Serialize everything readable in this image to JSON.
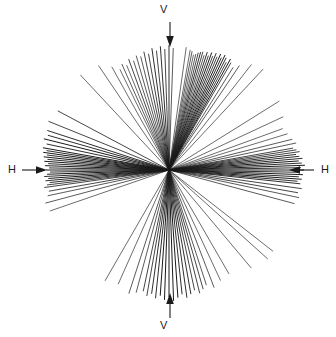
{
  "figure": {
    "title": "",
    "background_color": "#ffffff",
    "line_color": "#1a1a1a",
    "width": 336,
    "height": 337
  },
  "labels": {
    "v_top": "V",
    "v_bottom": "V",
    "h_left": "H",
    "h_right": "H"
  },
  "icons": {
    "arrow_down": "arrow-down-icon",
    "arrow_up": "arrow-up-icon",
    "arrow_right": "arrow-right-icon",
    "arrow_left": "arrow-left-icon"
  },
  "chart_data": {
    "type": "line",
    "title": "",
    "xlabel": "",
    "ylabel": "",
    "grid": false,
    "legend": null,
    "center": [
      169,
      170
    ],
    "axis_arrows": [
      {
        "name": "v-top",
        "label": "V",
        "direction": "down",
        "x": 170,
        "y1": 22,
        "y2": 46
      },
      {
        "name": "v-bottom",
        "label": "V",
        "direction": "up",
        "x": 170,
        "y1": 318,
        "y2": 294
      },
      {
        "name": "h-left",
        "label": "H",
        "direction": "right",
        "y": 170,
        "x1": 22,
        "x2": 46
      },
      {
        "name": "h-right",
        "label": "H",
        "direction": "left",
        "y": 170,
        "x1": 314,
        "x2": 290
      }
    ],
    "rays": [
      {
        "angle_deg": 82,
        "r_inner": 0,
        "r_outer": 124,
        "weight": 0.6
      },
      {
        "angle_deg": 80,
        "r_inner": 0,
        "r_outer": 122,
        "weight": 0.6
      },
      {
        "angle_deg": 79,
        "r_inner": 0,
        "r_outer": 121,
        "weight": 0.7
      },
      {
        "angle_deg": 78,
        "r_inner": 0,
        "r_outer": 118,
        "weight": 0.6
      },
      {
        "angle_deg": 77,
        "r_inner": 0,
        "r_outer": 119,
        "weight": 0.7
      },
      {
        "angle_deg": 76,
        "r_inner": 0,
        "r_outer": 121,
        "weight": 0.8
      },
      {
        "angle_deg": 75,
        "r_inner": 0,
        "r_outer": 122,
        "weight": 0.9
      },
      {
        "angle_deg": 74,
        "r_inner": 0,
        "r_outer": 123,
        "weight": 0.8
      },
      {
        "angle_deg": 73,
        "r_inner": 0,
        "r_outer": 120,
        "weight": 0.7
      },
      {
        "angle_deg": 72,
        "r_inner": 0,
        "r_outer": 124,
        "weight": 0.9
      },
      {
        "angle_deg": 71,
        "r_inner": 0,
        "r_outer": 121,
        "weight": 0.8
      },
      {
        "angle_deg": 70,
        "r_inner": 0,
        "r_outer": 125,
        "weight": 1.0
      },
      {
        "angle_deg": 69,
        "r_inner": 0,
        "r_outer": 122,
        "weight": 0.8
      },
      {
        "angle_deg": 68,
        "r_inner": 0,
        "r_outer": 126,
        "weight": 0.9
      },
      {
        "angle_deg": 67,
        "r_inner": 0,
        "r_outer": 123,
        "weight": 0.8
      },
      {
        "angle_deg": 66,
        "r_inner": 0,
        "r_outer": 127,
        "weight": 1.0
      },
      {
        "angle_deg": 65,
        "r_inner": 0,
        "r_outer": 124,
        "weight": 0.9
      },
      {
        "angle_deg": 64,
        "r_inner": 0,
        "r_outer": 128,
        "weight": 1.0
      },
      {
        "angle_deg": 63,
        "r_inner": 0,
        "r_outer": 126,
        "weight": 0.9
      },
      {
        "angle_deg": 62,
        "r_inner": 0,
        "r_outer": 122,
        "weight": 0.8
      },
      {
        "angle_deg": 61,
        "r_inner": 0,
        "r_outer": 127,
        "weight": 1.0
      },
      {
        "angle_deg": 60,
        "r_inner": 0,
        "r_outer": 124,
        "weight": 0.8
      },
      {
        "angle_deg": 58,
        "r_inner": 0,
        "r_outer": 121,
        "weight": 0.7
      },
      {
        "angle_deg": 56,
        "r_inner": 0,
        "r_outer": 126,
        "weight": 0.7
      },
      {
        "angle_deg": 52,
        "r_inner": 0,
        "r_outer": 134,
        "weight": 0.6
      },
      {
        "angle_deg": 47,
        "r_inner": 0,
        "r_outer": 138,
        "weight": 0.6
      },
      {
        "angle_deg": 88,
        "r_inner": 0,
        "r_outer": 122,
        "weight": 0.7
      },
      {
        "angle_deg": 90,
        "r_inner": 0,
        "r_outer": 125,
        "weight": 0.9
      },
      {
        "angle_deg": 92,
        "r_inner": 0,
        "r_outer": 121,
        "weight": 0.8
      },
      {
        "angle_deg": 94,
        "r_inner": 0,
        "r_outer": 124,
        "weight": 0.9
      },
      {
        "angle_deg": 96,
        "r_inner": 0,
        "r_outer": 120,
        "weight": 0.8
      },
      {
        "angle_deg": 98,
        "r_inner": 0,
        "r_outer": 123,
        "weight": 0.9
      },
      {
        "angle_deg": 100,
        "r_inner": 0,
        "r_outer": 118,
        "weight": 0.8
      },
      {
        "angle_deg": 102,
        "r_inner": 0,
        "r_outer": 121,
        "weight": 0.8
      },
      {
        "angle_deg": 104,
        "r_inner": 0,
        "r_outer": 117,
        "weight": 0.7
      },
      {
        "angle_deg": 106,
        "r_inner": 0,
        "r_outer": 119,
        "weight": 0.7
      },
      {
        "angle_deg": 108,
        "r_inner": 0,
        "r_outer": 115,
        "weight": 0.7
      },
      {
        "angle_deg": 110,
        "r_inner": 0,
        "r_outer": 118,
        "weight": 0.8
      },
      {
        "angle_deg": 112,
        "r_inner": 0,
        "r_outer": 113,
        "weight": 0.6
      },
      {
        "angle_deg": 114,
        "r_inner": 0,
        "r_outer": 116,
        "weight": 0.7
      },
      {
        "angle_deg": 116,
        "r_inner": 0,
        "r_outer": 112,
        "weight": 0.6
      },
      {
        "angle_deg": 119,
        "r_inner": 0,
        "r_outer": 118,
        "weight": 0.6
      },
      {
        "angle_deg": 124,
        "r_inner": 0,
        "r_outer": 126,
        "weight": 0.6
      },
      {
        "angle_deg": 133,
        "r_inner": 0,
        "r_outer": 130,
        "weight": 0.6
      },
      {
        "angle_deg": 152,
        "r_inner": 0,
        "r_outer": 126,
        "weight": 0.8
      },
      {
        "angle_deg": 158,
        "r_inner": 0,
        "r_outer": 130,
        "weight": 0.8
      },
      {
        "angle_deg": 162,
        "r_inner": 0,
        "r_outer": 128,
        "weight": 0.9
      },
      {
        "angle_deg": 164,
        "r_inner": 0,
        "r_outer": 126,
        "weight": 0.9
      },
      {
        "angle_deg": 166,
        "r_inner": 0,
        "r_outer": 129,
        "weight": 1.0
      },
      {
        "angle_deg": 168,
        "r_inner": 0,
        "r_outer": 125,
        "weight": 0.9
      },
      {
        "angle_deg": 170,
        "r_inner": 0,
        "r_outer": 128,
        "weight": 1.0
      },
      {
        "angle_deg": 171,
        "r_inner": 0,
        "r_outer": 124,
        "weight": 0.9
      },
      {
        "angle_deg": 172,
        "r_inner": 0,
        "r_outer": 127,
        "weight": 1.0
      },
      {
        "angle_deg": 173,
        "r_inner": 0,
        "r_outer": 123,
        "weight": 0.9
      },
      {
        "angle_deg": 174,
        "r_inner": 0,
        "r_outer": 126,
        "weight": 1.0
      },
      {
        "angle_deg": 175,
        "r_inner": 0,
        "r_outer": 122,
        "weight": 0.9
      },
      {
        "angle_deg": 176,
        "r_inner": 0,
        "r_outer": 125,
        "weight": 1.0
      },
      {
        "angle_deg": 177,
        "r_inner": 0,
        "r_outer": 121,
        "weight": 0.9
      },
      {
        "angle_deg": 178,
        "r_inner": 0,
        "r_outer": 124,
        "weight": 1.0
      },
      {
        "angle_deg": 179,
        "r_inner": 0,
        "r_outer": 120,
        "weight": 0.9
      },
      {
        "angle_deg": 180,
        "r_inner": 0,
        "r_outer": 123,
        "weight": 1.0
      },
      {
        "angle_deg": 181,
        "r_inner": 0,
        "r_outer": 119,
        "weight": 0.9
      },
      {
        "angle_deg": 182,
        "r_inner": 0,
        "r_outer": 122,
        "weight": 1.0
      },
      {
        "angle_deg": 183,
        "r_inner": 0,
        "r_outer": 125,
        "weight": 0.9
      },
      {
        "angle_deg": 184,
        "r_inner": 0,
        "r_outer": 121,
        "weight": 1.0
      },
      {
        "angle_deg": 185,
        "r_inner": 0,
        "r_outer": 124,
        "weight": 0.9
      },
      {
        "angle_deg": 186,
        "r_inner": 0,
        "r_outer": 120,
        "weight": 0.9
      },
      {
        "angle_deg": 187,
        "r_inner": 0,
        "r_outer": 123,
        "weight": 0.8
      },
      {
        "angle_deg": 188,
        "r_inner": 0,
        "r_outer": 126,
        "weight": 0.8
      },
      {
        "angle_deg": 190,
        "r_inner": 0,
        "r_outer": 122,
        "weight": 0.8
      },
      {
        "angle_deg": 192,
        "r_inner": 0,
        "r_outer": 124,
        "weight": 0.7
      },
      {
        "angle_deg": 195,
        "r_inner": 0,
        "r_outer": 128,
        "weight": 0.7
      },
      {
        "angle_deg": 199,
        "r_inner": 0,
        "r_outer": 126,
        "weight": 0.6
      },
      {
        "angle_deg": 240,
        "r_inner": 0,
        "r_outer": 128,
        "weight": 0.6
      },
      {
        "angle_deg": 246,
        "r_inner": 0,
        "r_outer": 125,
        "weight": 0.6
      },
      {
        "angle_deg": 252,
        "r_inner": 0,
        "r_outer": 130,
        "weight": 0.7
      },
      {
        "angle_deg": 255,
        "r_inner": 0,
        "r_outer": 127,
        "weight": 0.7
      },
      {
        "angle_deg": 258,
        "r_inner": 0,
        "r_outer": 124,
        "weight": 0.8
      },
      {
        "angle_deg": 260,
        "r_inner": 0,
        "r_outer": 128,
        "weight": 0.8
      },
      {
        "angle_deg": 262,
        "r_inner": 0,
        "r_outer": 125,
        "weight": 0.9
      },
      {
        "angle_deg": 264,
        "r_inner": 0,
        "r_outer": 129,
        "weight": 0.9
      },
      {
        "angle_deg": 266,
        "r_inner": 0,
        "r_outer": 126,
        "weight": 1.0
      },
      {
        "angle_deg": 268,
        "r_inner": 0,
        "r_outer": 130,
        "weight": 1.0
      },
      {
        "angle_deg": 270,
        "r_inner": 0,
        "r_outer": 127,
        "weight": 1.0
      },
      {
        "angle_deg": 272,
        "r_inner": 0,
        "r_outer": 131,
        "weight": 1.0
      },
      {
        "angle_deg": 274,
        "r_inner": 0,
        "r_outer": 128,
        "weight": 1.0
      },
      {
        "angle_deg": 276,
        "r_inner": 0,
        "r_outer": 125,
        "weight": 0.9
      },
      {
        "angle_deg": 278,
        "r_inner": 0,
        "r_outer": 129,
        "weight": 0.9
      },
      {
        "angle_deg": 280,
        "r_inner": 0,
        "r_outer": 126,
        "weight": 0.9
      },
      {
        "angle_deg": 282,
        "r_inner": 0,
        "r_outer": 123,
        "weight": 0.8
      },
      {
        "angle_deg": 284,
        "r_inner": 0,
        "r_outer": 127,
        "weight": 0.8
      },
      {
        "angle_deg": 286,
        "r_inner": 0,
        "r_outer": 124,
        "weight": 0.8
      },
      {
        "angle_deg": 288,
        "r_inner": 0,
        "r_outer": 121,
        "weight": 0.7
      },
      {
        "angle_deg": 291,
        "r_inner": 0,
        "r_outer": 126,
        "weight": 0.7
      },
      {
        "angle_deg": 295,
        "r_inner": 0,
        "r_outer": 122,
        "weight": 0.6
      },
      {
        "angle_deg": 300,
        "r_inner": 0,
        "r_outer": 120,
        "weight": 0.6
      },
      {
        "angle_deg": 310,
        "r_inner": 0,
        "r_outer": 128,
        "weight": 0.6
      },
      {
        "angle_deg": 322,
        "r_inner": 0,
        "r_outer": 132,
        "weight": 0.6
      },
      {
        "angle_deg": 345,
        "r_inner": 0,
        "r_outer": 130,
        "weight": 0.7
      },
      {
        "angle_deg": 348,
        "r_inner": 0,
        "r_outer": 133,
        "weight": 0.7
      },
      {
        "angle_deg": 350,
        "r_inner": 0,
        "r_outer": 131,
        "weight": 0.8
      },
      {
        "angle_deg": 352,
        "r_inner": 0,
        "r_outer": 134,
        "weight": 0.8
      },
      {
        "angle_deg": 354,
        "r_inner": 0,
        "r_outer": 132,
        "weight": 0.9
      },
      {
        "angle_deg": 355,
        "r_inner": 0,
        "r_outer": 129,
        "weight": 0.9
      },
      {
        "angle_deg": 356,
        "r_inner": 0,
        "r_outer": 133,
        "weight": 1.0
      },
      {
        "angle_deg": 357,
        "r_inner": 0,
        "r_outer": 130,
        "weight": 0.9
      },
      {
        "angle_deg": 358,
        "r_inner": 0,
        "r_outer": 134,
        "weight": 1.0
      },
      {
        "angle_deg": 359,
        "r_inner": 0,
        "r_outer": 131,
        "weight": 0.9
      },
      {
        "angle_deg": 0,
        "r_inner": 0,
        "r_outer": 135,
        "weight": 1.0
      },
      {
        "angle_deg": 1,
        "r_inner": 0,
        "r_outer": 132,
        "weight": 0.9
      },
      {
        "angle_deg": 2,
        "r_inner": 0,
        "r_outer": 136,
        "weight": 1.0
      },
      {
        "angle_deg": 3,
        "r_inner": 0,
        "r_outer": 133,
        "weight": 0.9
      },
      {
        "angle_deg": 4,
        "r_inner": 0,
        "r_outer": 130,
        "weight": 1.0
      },
      {
        "angle_deg": 5,
        "r_inner": 0,
        "r_outer": 134,
        "weight": 0.9
      },
      {
        "angle_deg": 6,
        "r_inner": 0,
        "r_outer": 131,
        "weight": 0.9
      },
      {
        "angle_deg": 7,
        "r_inner": 0,
        "r_outer": 128,
        "weight": 0.9
      },
      {
        "angle_deg": 8,
        "r_inner": 0,
        "r_outer": 132,
        "weight": 0.8
      },
      {
        "angle_deg": 9,
        "r_inner": 0,
        "r_outer": 129,
        "weight": 0.8
      },
      {
        "angle_deg": 10,
        "r_inner": 0,
        "r_outer": 126,
        "weight": 0.8
      },
      {
        "angle_deg": 12,
        "r_inner": 0,
        "r_outer": 130,
        "weight": 0.7
      },
      {
        "angle_deg": 14,
        "r_inner": 0,
        "r_outer": 127,
        "weight": 0.7
      },
      {
        "angle_deg": 17,
        "r_inner": 0,
        "r_outer": 124,
        "weight": 0.6
      },
      {
        "angle_deg": 20,
        "r_inner": 0,
        "r_outer": 121,
        "weight": 0.6
      },
      {
        "angle_deg": 25,
        "r_inner": 0,
        "r_outer": 126,
        "weight": 0.6
      },
      {
        "angle_deg": 32,
        "r_inner": 0,
        "r_outer": 130,
        "weight": 0.6
      },
      {
        "angle_deg": 318,
        "r_inner": 0,
        "r_outer": 133,
        "weight": 0.6
      }
    ]
  }
}
